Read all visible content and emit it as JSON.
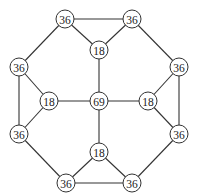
{
  "diagram": {
    "type": "graph",
    "node_radius": 9,
    "colors": {
      "stroke": "#333333",
      "fill": "#ffffff",
      "text": "#222222"
    },
    "nodes": [
      {
        "id": "t1",
        "label": "36",
        "x": 65,
        "y": 19
      },
      {
        "id": "t2",
        "label": "36",
        "x": 132,
        "y": 19
      },
      {
        "id": "tc",
        "label": "18",
        "x": 99,
        "y": 50
      },
      {
        "id": "l1",
        "label": "36",
        "x": 19,
        "y": 67
      },
      {
        "id": "l2",
        "label": "36",
        "x": 19,
        "y": 134
      },
      {
        "id": "lc",
        "label": "18",
        "x": 49,
        "y": 101
      },
      {
        "id": "c",
        "label": "69",
        "x": 99,
        "y": 101
      },
      {
        "id": "rc",
        "label": "18",
        "x": 148,
        "y": 101
      },
      {
        "id": "r1",
        "label": "36",
        "x": 179,
        "y": 67
      },
      {
        "id": "r2",
        "label": "36",
        "x": 179,
        "y": 134
      },
      {
        "id": "bc",
        "label": "18",
        "x": 99,
        "y": 152
      },
      {
        "id": "b1",
        "label": "36",
        "x": 66,
        "y": 183
      },
      {
        "id": "b2",
        "label": "36",
        "x": 132,
        "y": 183
      }
    ],
    "edges": [
      [
        "t1",
        "t2"
      ],
      [
        "t1",
        "l1"
      ],
      [
        "t2",
        "r1"
      ],
      [
        "l1",
        "l2"
      ],
      [
        "r1",
        "r2"
      ],
      [
        "l2",
        "b1"
      ],
      [
        "r2",
        "b2"
      ],
      [
        "b1",
        "b2"
      ],
      [
        "t1",
        "tc"
      ],
      [
        "t2",
        "tc"
      ],
      [
        "l1",
        "lc"
      ],
      [
        "l2",
        "lc"
      ],
      [
        "r1",
        "rc"
      ],
      [
        "r2",
        "rc"
      ],
      [
        "b1",
        "bc"
      ],
      [
        "b2",
        "bc"
      ],
      [
        "tc",
        "c"
      ],
      [
        "lc",
        "c"
      ],
      [
        "rc",
        "c"
      ],
      [
        "bc",
        "c"
      ]
    ]
  }
}
